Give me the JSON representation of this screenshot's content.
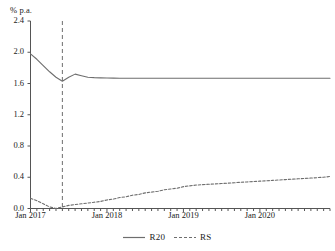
{
  "chart_data": {
    "type": "line",
    "title": "",
    "subtitle": "",
    "ylabel": "% p.a.",
    "xlabel": "",
    "ylim": [
      0.0,
      2.4
    ],
    "yticks": [
      "0.0",
      "0.4",
      "0.8",
      "1.2",
      "1.6",
      "2.0",
      "2.4"
    ],
    "ytick_values": [
      0.0,
      0.4,
      0.8,
      1.2,
      1.6,
      2.0,
      2.4
    ],
    "xticks": [
      "Jan 2017",
      "Jan 2018",
      "Jan 2019",
      "Jan 2020"
    ],
    "xlim": [
      "2017-01",
      "2020-12"
    ],
    "grid": false,
    "legend_position": "bottom-center",
    "annotations": [
      {
        "name": "forecast-start-line",
        "style": "vertical-dashed",
        "x": "2017-06"
      }
    ],
    "x": [
      "2017-01",
      "2017-02",
      "2017-03",
      "2017-04",
      "2017-05",
      "2017-06",
      "2017-07",
      "2017-08",
      "2017-09",
      "2017-10",
      "2017-11",
      "2017-12",
      "2018-01",
      "2018-02",
      "2018-03",
      "2018-04",
      "2018-05",
      "2018-06",
      "2018-07",
      "2018-08",
      "2018-09",
      "2018-10",
      "2018-11",
      "2018-12",
      "2019-01",
      "2019-02",
      "2019-03",
      "2019-04",
      "2019-05",
      "2019-06",
      "2019-07",
      "2019-08",
      "2019-09",
      "2019-10",
      "2019-11",
      "2019-12",
      "2020-01",
      "2020-02",
      "2020-03",
      "2020-04",
      "2020-05",
      "2020-06",
      "2020-07",
      "2020-08",
      "2020-09",
      "2020-10",
      "2020-11",
      "2020-12"
    ],
    "series": [
      {
        "name": "R20",
        "style": "solid",
        "color": "#6e6e6e",
        "values": [
          1.98,
          1.91,
          1.83,
          1.75,
          1.68,
          1.63,
          1.68,
          1.72,
          1.7,
          1.68,
          1.675,
          1.672,
          1.67,
          1.669,
          1.668,
          1.668,
          1.667,
          1.667,
          1.667,
          1.667,
          1.667,
          1.667,
          1.667,
          1.667,
          1.667,
          1.667,
          1.667,
          1.667,
          1.667,
          1.667,
          1.667,
          1.667,
          1.667,
          1.667,
          1.667,
          1.667,
          1.667,
          1.667,
          1.667,
          1.667,
          1.667,
          1.667,
          1.667,
          1.667,
          1.667,
          1.667,
          1.667,
          1.667
        ]
      },
      {
        "name": "RS",
        "style": "dashed",
        "color": "#6e6e6e",
        "values": [
          0.13,
          0.1,
          0.06,
          0.02,
          0.0,
          0.02,
          0.04,
          0.05,
          0.06,
          0.07,
          0.08,
          0.09,
          0.11,
          0.12,
          0.14,
          0.15,
          0.17,
          0.18,
          0.2,
          0.21,
          0.22,
          0.24,
          0.25,
          0.26,
          0.28,
          0.29,
          0.3,
          0.305,
          0.31,
          0.315,
          0.32,
          0.325,
          0.33,
          0.335,
          0.34,
          0.345,
          0.35,
          0.355,
          0.36,
          0.365,
          0.37,
          0.375,
          0.38,
          0.385,
          0.39,
          0.395,
          0.4,
          0.41
        ]
      }
    ],
    "legend": [
      {
        "label": "R20",
        "style": "solid"
      },
      {
        "label": "RS",
        "style": "dashed"
      }
    ]
  }
}
